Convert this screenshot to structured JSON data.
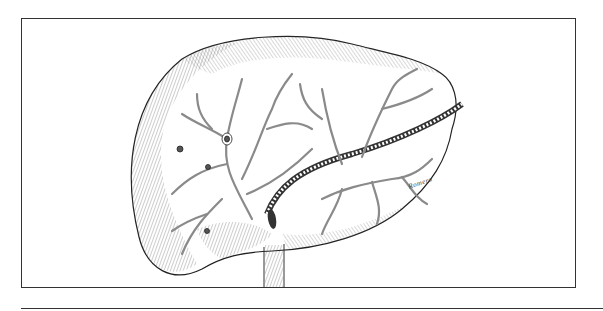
{
  "figure": {
    "artist_signature": "Romero",
    "colors": {
      "ink": "#333333",
      "vessel": "#8a8a8a",
      "background": "#ffffff"
    }
  }
}
